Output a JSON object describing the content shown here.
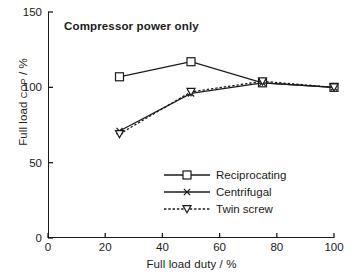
{
  "chart_data": {
    "type": "line",
    "title": "Compressor power only",
    "xlabel": "Full load duty / %",
    "ylabel_main": "Full load ",
    "ylabel_smallcaps": "COP",
    "ylabel_suffix": " / %",
    "ylabel": "Full load COP / %",
    "xlim": [
      0,
      100
    ],
    "ylim": [
      0,
      150
    ],
    "xticks": [
      0,
      20,
      40,
      60,
      80,
      100
    ],
    "yticks": [
      0,
      50,
      100,
      150
    ],
    "xtick_labels": [
      "0",
      "20",
      "40",
      "60",
      "80",
      "100"
    ],
    "ytick_labels": [
      "0",
      "50",
      "100",
      "150"
    ],
    "grid": false,
    "legend_position": "lower-right-inside",
    "x": [
      25,
      50,
      75,
      100
    ],
    "series": [
      {
        "name": "Reciprocating",
        "marker": "open-square",
        "linestyle": "solid",
        "color": "#1a1a1a",
        "x": [
          25,
          50,
          75,
          100
        ],
        "values": [
          107,
          117,
          103,
          100
        ]
      },
      {
        "name": "Centrifugal",
        "marker": "x-cross",
        "linestyle": "solid",
        "color": "#1a1a1a",
        "x": [
          25,
          50,
          75,
          100
        ],
        "values": [
          71,
          96,
          103,
          100
        ]
      },
      {
        "name": "Twin screw",
        "marker": "open-triangle-down",
        "linestyle": "dotted",
        "color": "#1a1a1a",
        "x": [
          25,
          50,
          75,
          100
        ],
        "values": [
          69,
          97,
          104,
          100
        ]
      }
    ]
  },
  "legend": {
    "items": [
      {
        "label": "Reciprocating"
      },
      {
        "label": "Centrifugal"
      },
      {
        "label": "Twin screw"
      }
    ]
  },
  "colors": {
    "ink": "#1a1a1a",
    "background": "#ffffff"
  }
}
